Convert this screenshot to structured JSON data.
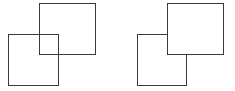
{
  "diagram": {
    "stroke_color": "#3a3a3a",
    "fill_color": "#ffffff",
    "groups": [
      {
        "name": "transparent-overlap",
        "squares": [
          {
            "role": "top-right",
            "x": 39,
            "y": 3,
            "w": 57,
            "h": 52,
            "fill": "none"
          },
          {
            "role": "bottom-left",
            "x": 8,
            "y": 34,
            "w": 51,
            "h": 52,
            "fill": "none"
          }
        ]
      },
      {
        "name": "opaque-overlap",
        "squares": [
          {
            "role": "bottom-left-back",
            "x": 137,
            "y": 34,
            "w": 50,
            "h": 52,
            "fill": "#ffffff"
          },
          {
            "role": "top-right-front",
            "x": 167,
            "y": 3,
            "w": 57,
            "h": 52,
            "fill": "#ffffff"
          }
        ]
      }
    ]
  }
}
